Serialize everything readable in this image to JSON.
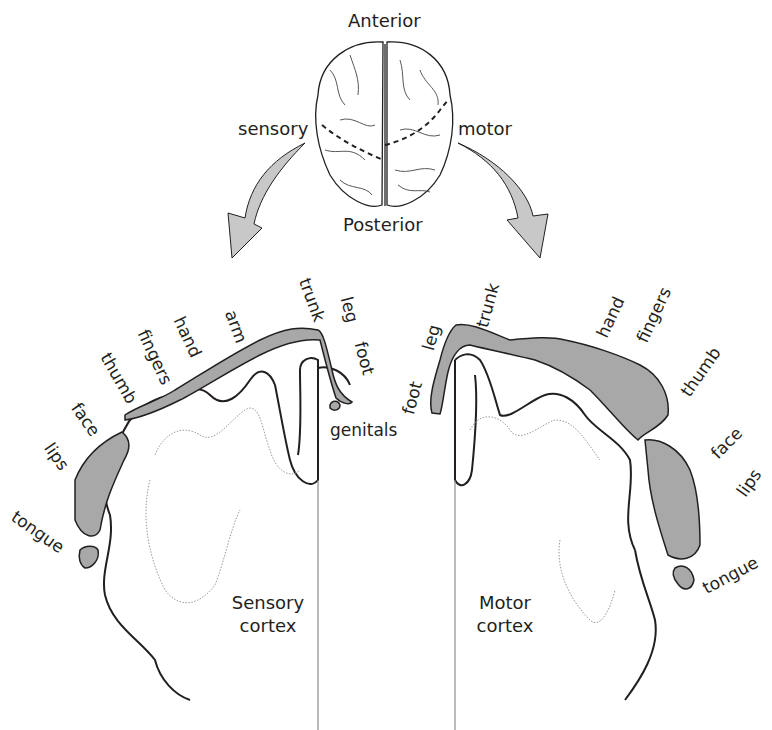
{
  "top": {
    "anterior_label": "Anterior",
    "posterior_label": "Posterior",
    "sensory_arrow_label": "sensory",
    "motor_arrow_label": "motor"
  },
  "sensory": {
    "cortex_label_line1": "Sensory",
    "cortex_label_line2": "cortex",
    "body_parts": [
      "genitals",
      "foot",
      "leg",
      "trunk",
      "arm",
      "hand",
      "fingers",
      "thumb",
      "face",
      "lips",
      "tongue"
    ]
  },
  "motor": {
    "cortex_label_line1": "Motor",
    "cortex_label_line2": "cortex",
    "body_parts": [
      "foot",
      "leg",
      "trunk",
      "hand",
      "fingers",
      "thumb",
      "face",
      "lips",
      "tongue"
    ]
  },
  "colors": {
    "homunculus_fill": "#a8a8a8",
    "arrow_fill": "#c8c8c8",
    "outline": "#231f20",
    "inner_line": "#9a9a9a"
  }
}
